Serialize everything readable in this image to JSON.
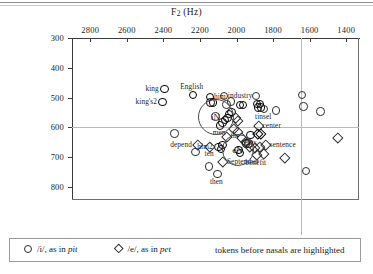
{
  "figure": {
    "background": "#ffffff",
    "frame_color": "#3a3a3a",
    "grid_color": "#b9b9b9",
    "marker_color": "#2e2e2e",
    "highlight_color": "#000000"
  },
  "axes": {
    "x_title_main": "F",
    "x_title_sub": "2",
    "x_title_unit": " (Hz)",
    "y_title_main": "F",
    "y_title_sub": "1",
    "y_title_unit": " (Hz)",
    "x_ticks": [
      "2800",
      "2600",
      "2400",
      "2200",
      "2000",
      "1800",
      "1600",
      "1400"
    ],
    "y_ticks": [
      "300",
      "400",
      "500",
      "600",
      "700",
      "800"
    ],
    "x_range": [
      2900,
      1330
    ],
    "y_range": [
      300,
      840
    ],
    "x_direction": "reversed",
    "y_direction": "reversed",
    "gridline_x_value": 1650,
    "gridline_y_value": 600
  },
  "annotations": [
    {
      "text": "iN",
      "x": 2120,
      "y": 560,
      "r": 17
    },
    {
      "text": "eN",
      "x": 2000,
      "y": 672,
      "r": 15
    }
  ],
  "legend": {
    "entry1": {
      "symbol": "circle",
      "text_a": "/i/, as in ",
      "text_b": "pit"
    },
    "entry2": {
      "symbol": "diamond",
      "text_a": "/e/, as in ",
      "text_b": "pet"
    },
    "note": "tokens before nasals are highlighted"
  },
  "chart_data": {
    "type": "scatter",
    "title": "",
    "xlabel": "F2 (Hz)",
    "ylabel": "F1 (Hz)",
    "xlim": [
      2900,
      1330
    ],
    "ylim": [
      840,
      300
    ],
    "x_inverted": true,
    "y_inverted": true,
    "grid": true,
    "legend_position": "below-plot",
    "series": [
      {
        "name": "/i/, as in pit",
        "marker": "circle",
        "points": [
          {
            "x": 2400,
            "y": 467,
            "label": "king",
            "label_pos": "left",
            "highlighted": true
          },
          {
            "x": 2410,
            "y": 512,
            "label": "king's2",
            "label_pos": "left",
            "highlighted": true
          },
          {
            "x": 2245,
            "y": 487,
            "label": "English",
            "label_pos": "above",
            "highlighted": true
          },
          {
            "x": 2150,
            "y": 495,
            "label": "him",
            "label_pos": "right",
            "highlighted": true
          },
          {
            "x": 2148,
            "y": 513,
            "label": "",
            "highlighted": true
          },
          {
            "x": 2133,
            "y": 513,
            "label": "",
            "highlighted": true
          },
          {
            "x": 2075,
            "y": 492,
            "label": "industry",
            "label_pos": "right",
            "highlighted": false
          },
          {
            "x": 2060,
            "y": 520,
            "label": "",
            "highlighted": false
          },
          {
            "x": 2035,
            "y": 509,
            "label": "",
            "highlighted": false
          },
          {
            "x": 1985,
            "y": 522,
            "label": "",
            "highlighted": true
          },
          {
            "x": 1970,
            "y": 522,
            "label": "",
            "highlighted": true
          },
          {
            "x": 1900,
            "y": 492,
            "label": "",
            "highlighted": false
          },
          {
            "x": 1893,
            "y": 518,
            "label": "",
            "highlighted": true
          },
          {
            "x": 1878,
            "y": 518,
            "label": "",
            "highlighted": true
          },
          {
            "x": 1888,
            "y": 530,
            "label": "",
            "highlighted": true
          },
          {
            "x": 1873,
            "y": 530,
            "label": "",
            "highlighted": true
          },
          {
            "x": 1855,
            "y": 535,
            "label": "tinsel",
            "label_pos": "below",
            "highlighted": false
          },
          {
            "x": 1790,
            "y": 540,
            "label": "",
            "highlighted": false
          },
          {
            "x": 1648,
            "y": 487,
            "label": "",
            "highlighted": false
          },
          {
            "x": 1640,
            "y": 527,
            "label": "",
            "highlighted": false
          },
          {
            "x": 1545,
            "y": 543,
            "label": "",
            "highlighted": false
          },
          {
            "x": 2120,
            "y": 560,
            "label": "",
            "highlighted": false
          },
          {
            "x": 2095,
            "y": 590,
            "label": "men",
            "label_pos": "below",
            "highlighted": true
          },
          {
            "x": 2082,
            "y": 580,
            "label": "",
            "highlighted": true
          },
          {
            "x": 2068,
            "y": 572,
            "label": "",
            "highlighted": true
          },
          {
            "x": 2055,
            "y": 565,
            "label": "",
            "highlighted": true
          },
          {
            "x": 2045,
            "y": 552,
            "label": "",
            "highlighted": true
          },
          {
            "x": 2032,
            "y": 545,
            "label": "",
            "highlighted": true
          },
          {
            "x": 2105,
            "y": 663,
            "label": "him2",
            "label_pos": "left",
            "highlighted": true
          },
          {
            "x": 2090,
            "y": 668,
            "label": "",
            "highlighted": true
          },
          {
            "x": 2082,
            "y": 655,
            "label": "",
            "highlighted": true
          },
          {
            "x": 1955,
            "y": 650,
            "label": "",
            "highlighted": true
          },
          {
            "x": 1940,
            "y": 650,
            "label": "",
            "highlighted": true
          },
          {
            "x": 1995,
            "y": 672,
            "label": "",
            "highlighted": true
          },
          {
            "x": 1985,
            "y": 683,
            "label": "",
            "highlighted": true
          },
          {
            "x": 1930,
            "y": 622,
            "label": "cents",
            "label_pos": "below",
            "highlighted": true
          },
          {
            "x": 2345,
            "y": 617,
            "label": "",
            "highlighted": false
          },
          {
            "x": 2230,
            "y": 680,
            "label": "",
            "highlighted": false
          },
          {
            "x": 2155,
            "y": 728,
            "label": "",
            "highlighted": false
          },
          {
            "x": 2110,
            "y": 752,
            "label": "then",
            "label_pos": "below",
            "highlighted": false
          },
          {
            "x": 1625,
            "y": 743,
            "label": "",
            "highlighted": false
          }
        ]
      },
      {
        "name": "/e/, as in pet",
        "marker": "diamond",
        "points": [
          {
            "x": 2010,
            "y": 563,
            "label": "",
            "highlighted": false
          },
          {
            "x": 1998,
            "y": 575,
            "label": "",
            "highlighted": false
          },
          {
            "x": 2018,
            "y": 600,
            "label": "",
            "highlighted": false
          },
          {
            "x": 2000,
            "y": 612,
            "label": "",
            "highlighted": false
          },
          {
            "x": 2060,
            "y": 627,
            "label": "tin",
            "label_pos": "right",
            "highlighted": false
          },
          {
            "x": 1975,
            "y": 630,
            "label": "",
            "highlighted": false
          },
          {
            "x": 1955,
            "y": 645,
            "label": "",
            "highlighted": false
          },
          {
            "x": 1885,
            "y": 592,
            "label": "center",
            "label_pos": "right",
            "highlighted": false
          },
          {
            "x": 1887,
            "y": 618,
            "label": "",
            "highlighted": true
          },
          {
            "x": 1872,
            "y": 618,
            "label": "",
            "highlighted": true
          },
          {
            "x": 1935,
            "y": 662,
            "label": "",
            "highlighted": false
          },
          {
            "x": 1905,
            "y": 665,
            "label": "",
            "highlighted": false
          },
          {
            "x": 1880,
            "y": 663,
            "label": "",
            "highlighted": false
          },
          {
            "x": 1845,
            "y": 655,
            "label": "sentence",
            "label_pos": "right",
            "highlighted": false
          },
          {
            "x": 1895,
            "y": 690,
            "label": "benefit",
            "label_pos": "below",
            "highlighted": false
          },
          {
            "x": 1855,
            "y": 685,
            "label": "",
            "highlighted": false
          },
          {
            "x": 2215,
            "y": 655,
            "label": "depend",
            "label_pos": "left",
            "highlighted": false
          },
          {
            "x": 2150,
            "y": 660,
            "label": "ten",
            "label_pos": "below",
            "highlighted": false
          },
          {
            "x": 2080,
            "y": 712,
            "label": "September",
            "label_pos": "right",
            "highlighted": false
          },
          {
            "x": 1740,
            "y": 700,
            "label": "",
            "highlighted": false
          },
          {
            "x": 1450,
            "y": 630,
            "label": "",
            "highlighted": false
          }
        ]
      }
    ]
  }
}
